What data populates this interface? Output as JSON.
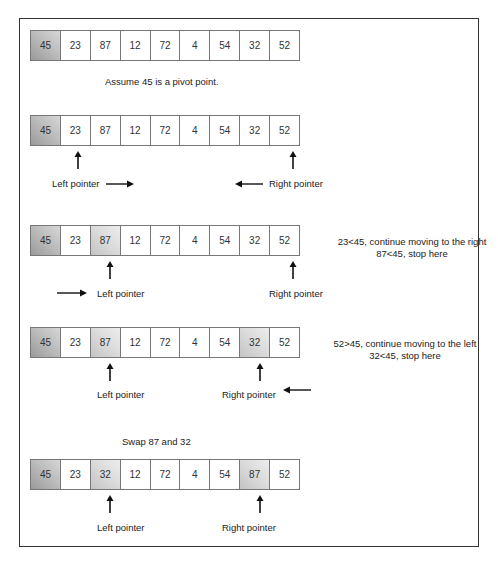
{
  "colors": {
    "pivot": "#a8a8a8",
    "highlight": "#d8d8d8",
    "border": "#333333"
  },
  "steps": [
    {
      "cells": [
        "45",
        "23",
        "87",
        "12",
        "72",
        "4",
        "54",
        "32",
        "52"
      ],
      "caption": "Assume 45 is a pivot point."
    },
    {
      "cells": [
        "45",
        "23",
        "87",
        "12",
        "72",
        "4",
        "54",
        "32",
        "52"
      ],
      "left_label": "Left pointer",
      "right_label": "Right pointer"
    },
    {
      "cells": [
        "45",
        "23",
        "87",
        "12",
        "72",
        "4",
        "54",
        "32",
        "52"
      ],
      "left_label": "Left pointer",
      "right_label": "Right pointer",
      "note_line1": "23<45, continue moving to the right",
      "note_line2": "87<45, stop here"
    },
    {
      "cells": [
        "45",
        "23",
        "87",
        "12",
        "72",
        "4",
        "54",
        "32",
        "52"
      ],
      "left_label": "Left pointer",
      "right_label": "Right pointer",
      "note_line1": "52>45, continue moving to the left",
      "note_line2": "32<45, stop here"
    },
    {
      "caption": "Swap 87 and 32",
      "cells": [
        "45",
        "23",
        "32",
        "12",
        "72",
        "4",
        "54",
        "87",
        "52"
      ],
      "left_label": "Left pointer",
      "right_label": "Right pointer"
    }
  ],
  "icons": {
    "up_arrow": "arrow-up",
    "right_arrow": "arrow-right",
    "left_arrow": "arrow-left"
  }
}
